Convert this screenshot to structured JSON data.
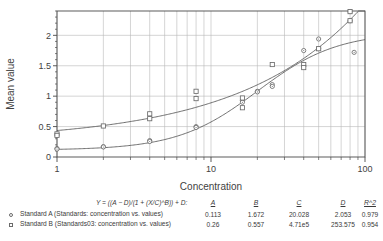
{
  "chart_data": {
    "type": "scatter",
    "title": "",
    "xlabel": "Concentration",
    "ylabel": "Mean value",
    "xscale": "log",
    "xlim": [
      1,
      100
    ],
    "ylim": [
      0,
      2.4
    ],
    "xticks": [
      1,
      10,
      100
    ],
    "xtick_labels": [
      "1",
      "10",
      "100"
    ],
    "yticks": [
      0,
      0.5,
      1,
      1.5,
      2
    ],
    "ytick_labels": [
      "0",
      "0.5",
      "1",
      "1.5",
      "2"
    ],
    "grid": true,
    "legend_position": "below",
    "series": [
      {
        "name": "Standard A (Standards: concentration vs. values)",
        "marker": "circle",
        "points": [
          {
            "x": 1,
            "y": 0.14
          },
          {
            "x": 1,
            "y": 0.13
          },
          {
            "x": 2,
            "y": 0.17
          },
          {
            "x": 2,
            "y": 0.165
          },
          {
            "x": 4,
            "y": 0.27
          },
          {
            "x": 4,
            "y": 0.255
          },
          {
            "x": 8,
            "y": 0.5
          },
          {
            "x": 8,
            "y": 0.485
          },
          {
            "x": 16,
            "y": 0.93
          },
          {
            "x": 16,
            "y": 0.9
          },
          {
            "x": 20,
            "y": 1.08
          },
          {
            "x": 20,
            "y": 1.07
          },
          {
            "x": 25,
            "y": 1.19
          },
          {
            "x": 25,
            "y": 1.16
          },
          {
            "x": 40,
            "y": 1.75
          },
          {
            "x": 50,
            "y": 1.94
          },
          {
            "x": 50,
            "y": 1.78
          },
          {
            "x": 80,
            "y": 2.39
          },
          {
            "x": 80,
            "y": 2.24
          },
          {
            "x": 85,
            "y": 1.72
          }
        ],
        "fit": {
          "A": 0.113,
          "B": 1.672,
          "C": 20.028,
          "D": 2.053,
          "R2": 0.979
        }
      },
      {
        "name": "Standard B (Standards03: concentration vs. values)",
        "marker": "square",
        "points": [
          {
            "x": 1,
            "y": 0.38
          },
          {
            "x": 1,
            "y": 0.355
          },
          {
            "x": 2,
            "y": 0.51
          },
          {
            "x": 4,
            "y": 0.71
          },
          {
            "x": 4,
            "y": 0.63
          },
          {
            "x": 8,
            "y": 1.08
          },
          {
            "x": 8,
            "y": 0.96
          },
          {
            "x": 16,
            "y": 0.97
          },
          {
            "x": 16,
            "y": 0.81
          },
          {
            "x": 25,
            "y": 1.52
          },
          {
            "x": 40,
            "y": 1.52
          },
          {
            "x": 40,
            "y": 1.47
          },
          {
            "x": 50,
            "y": 1.78
          },
          {
            "x": 80,
            "y": 2.39
          },
          {
            "x": 80,
            "y": 2.24
          }
        ],
        "fit": {
          "A": 0.26,
          "B": 0.557,
          "C": 471000,
          "D": 253.575,
          "R2": 0.954
        }
      }
    ]
  },
  "footer": {
    "equation": "Y = ((A − D)/(1 + (X/C)^B)) + D:",
    "headers": {
      "a": "A",
      "b": "B",
      "c": "C",
      "d": "D",
      "r2": "R^2"
    },
    "rows": [
      {
        "label": "Standard A (Standards: concentration vs. values)",
        "marker": "circle-marker",
        "a": "0.113",
        "b": "1.672",
        "c": "20.028",
        "d": "2.053",
        "r2": "0.979"
      },
      {
        "label": "Standard B (Standards03: concentration vs. values)",
        "marker": "square-marker",
        "a": "0.26",
        "b": "0.557",
        "c": "4.71e5",
        "d": "253.575",
        "r2": "0.954"
      }
    ]
  },
  "colors": {
    "axis": "#4a4a4a",
    "grid": "#b8b8b8",
    "curve": "#555555",
    "marker": "#6b6b6b",
    "text": "#3a3a3a"
  }
}
